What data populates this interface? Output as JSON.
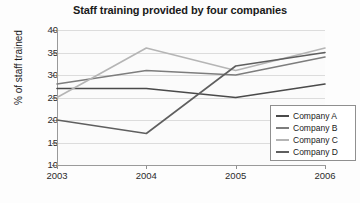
{
  "chart_data": {
    "type": "line",
    "title": "Staff training provided by four companies",
    "xlabel": "",
    "ylabel": "% of staff trained",
    "x": [
      "2003",
      "2004",
      "2005",
      "2006"
    ],
    "categories": [
      "2003",
      "2004",
      "2005",
      "2006"
    ],
    "ylim": [
      10,
      40
    ],
    "yticks": [
      10,
      15,
      20,
      25,
      30,
      35,
      40
    ],
    "ytick_labels": [
      "10",
      "15",
      "20",
      "25",
      "30",
      "35",
      "40"
    ],
    "grid": true,
    "legend_position": "bottom-right",
    "series": [
      {
        "name": "Company A",
        "values": [
          27,
          27,
          25,
          28
        ],
        "color": "#4a4a4a"
      },
      {
        "name": "Company B",
        "values": [
          28,
          31,
          30,
          34
        ],
        "color": "#7d7d7d"
      },
      {
        "name": "Company C",
        "values": [
          25,
          36,
          31,
          36
        ],
        "color": "#b5b5b5"
      },
      {
        "name": "Company D",
        "values": [
          20,
          17,
          32,
          35
        ],
        "color": "#5f5f5f"
      }
    ]
  }
}
